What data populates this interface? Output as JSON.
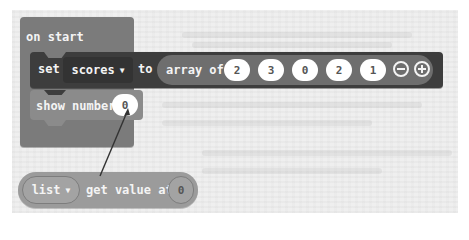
{
  "workspace": {
    "background_color": "#efefef"
  },
  "on_start": {
    "label": "on start",
    "color": "#7b7b7b"
  },
  "set_block": {
    "set_label": "set",
    "variable": "scores",
    "caret": "▼",
    "to_label": "to",
    "color": "#3d3d3d",
    "array": {
      "label": "array of",
      "values": [
        "2",
        "3",
        "0",
        "2",
        "1"
      ],
      "remove_icon": "minus-circle-icon",
      "add_icon": "plus-circle-icon"
    }
  },
  "show_number": {
    "label": "show number",
    "value": "0"
  },
  "get_value": {
    "list_label": "list",
    "caret": "▼",
    "label": "get value at",
    "index": "0"
  },
  "annotation": {
    "type": "arrow",
    "from": "get-value-block",
    "to": "show-number-input"
  }
}
